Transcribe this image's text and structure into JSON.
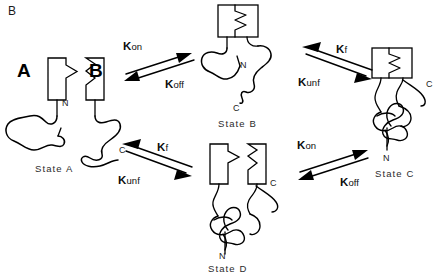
{
  "figure": {
    "panel_label": "B",
    "type": "protein-binding-folding-scheme"
  },
  "states": {
    "a": {
      "name": "State A",
      "n_terminus": "N",
      "c_terminus": "C",
      "domain_a_letter": "A",
      "domain_b_letter": "B"
    },
    "b": {
      "name": "State B",
      "n_terminus": "N",
      "c_terminus": "C"
    },
    "c": {
      "name": "State C",
      "n_terminus": "N",
      "c_terminus": "C"
    },
    "d": {
      "name": "State D",
      "n_terminus": "N",
      "c_terminus": "C"
    }
  },
  "reactions": {
    "a_to_b": {
      "forward_k": "K",
      "forward_sub": "on",
      "reverse_k": "K",
      "reverse_sub": "off"
    },
    "a_to_d": {
      "forward_k": "K",
      "forward_sub": "f",
      "reverse_k": "K",
      "reverse_sub": "unf"
    },
    "b_to_c": {
      "forward_k": "K",
      "forward_sub": "f",
      "reverse_k": "K",
      "reverse_sub": "unf"
    },
    "d_to_c": {
      "forward_k": "K",
      "forward_sub": "on",
      "reverse_k": "K",
      "reverse_sub": "off"
    }
  },
  "colors": {
    "ink": "#000000",
    "background": "#ffffff",
    "text": "#1a1a1a"
  }
}
